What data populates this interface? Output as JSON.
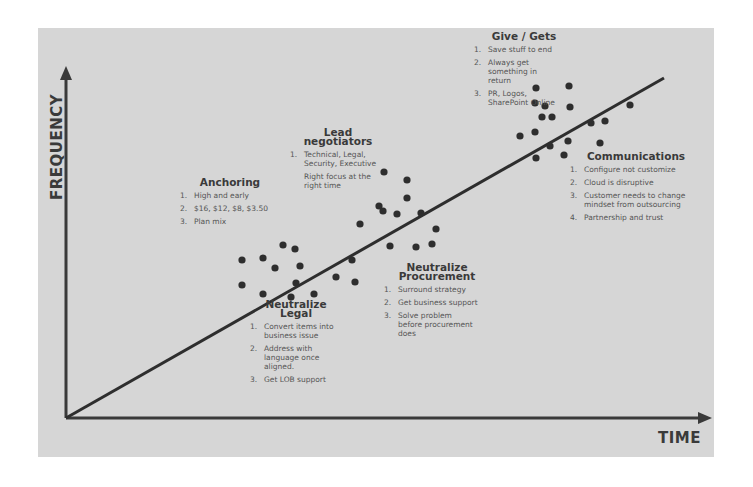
{
  "axes": {
    "y_label": "FREQUENCY",
    "x_label": "TIME"
  },
  "colors": {
    "background": "#d6d6d6",
    "ink": "#3a3a3a",
    "text": "#555555"
  },
  "stages": [
    {
      "title": "Anchoring",
      "items": [
        {
          "num": "1.",
          "text": "High and early"
        },
        {
          "num": "2.",
          "text": "$16, $12, $8, $3.50"
        },
        {
          "num": "3.",
          "text": "Plan mix"
        }
      ]
    },
    {
      "title": "Lead negotiators",
      "items": [
        {
          "num": "1.",
          "text": "Technical, Legal, Security, Executive"
        }
      ],
      "note": "Right focus at the right time"
    },
    {
      "title": "Neutralize Legal",
      "items": [
        {
          "num": "1.",
          "text": "Convert items into business issue"
        },
        {
          "num": "2.",
          "text": "Address with language once aligned."
        },
        {
          "num": "3.",
          "text": "Get LOB support"
        }
      ]
    },
    {
      "title": "Neutralize Procurement",
      "items": [
        {
          "num": "1.",
          "text": "Surround strategy"
        },
        {
          "num": "2.",
          "text": "Get business support"
        },
        {
          "num": "3.",
          "text": "Solve problem before procurement does"
        }
      ]
    },
    {
      "title": "Give / Gets",
      "items": [
        {
          "num": "1.",
          "text": "Save stuff to end"
        },
        {
          "num": "2.",
          "text": "Always get something in return"
        },
        {
          "num": "3.",
          "text": "PR, Logos, SharePoint Online"
        }
      ]
    },
    {
      "title": "Communications",
      "items": [
        {
          "num": "1.",
          "text": "Configure not customize"
        },
        {
          "num": "2.",
          "text": "Cloud is disruptive"
        },
        {
          "num": "3.",
          "text": "Customer needs to change mindset from outsourcing"
        },
        {
          "num": "4.",
          "text": "Partnership and trust"
        }
      ]
    }
  ]
}
